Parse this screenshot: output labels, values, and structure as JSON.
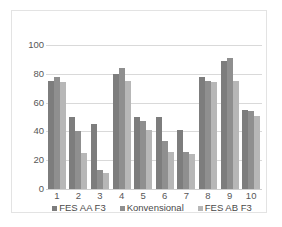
{
  "chart_data": {
    "type": "bar",
    "title": "",
    "subtitle": "",
    "xlabel": "",
    "ylabel": "",
    "ylim": [
      0,
      100
    ],
    "yticks": [
      0,
      20,
      40,
      60,
      80,
      100
    ],
    "ytick_labels": [
      "0",
      "20",
      "40",
      "60",
      "80",
      "100"
    ],
    "grid": true,
    "legend_position": "bottom",
    "categories": [
      "1",
      "2",
      "3",
      "4",
      "5",
      "6",
      "7",
      "8",
      "9",
      "10"
    ],
    "series": [
      {
        "name": "FES AA F3",
        "color": "#7d7d7d",
        "values": [
          75,
          50,
          45,
          80,
          50,
          50,
          41,
          78,
          89,
          55
        ]
      },
      {
        "name": "Konvensional",
        "color": "#8f8f8f",
        "values": [
          78,
          40,
          13,
          84,
          47,
          33,
          26,
          75,
          91,
          54
        ]
      },
      {
        "name": "FES AB F3",
        "color": "#b7b7b7",
        "values": [
          74,
          25,
          11,
          75,
          41,
          26,
          24,
          74,
          75,
          51
        ]
      }
    ]
  },
  "legend": {
    "items": [
      {
        "label": "FES AA F3"
      },
      {
        "label": "Konvensional"
      },
      {
        "label": "FES AB F3"
      }
    ]
  }
}
